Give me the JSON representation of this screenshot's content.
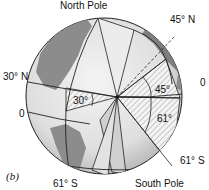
{
  "figure": {
    "panel_label": "(b)",
    "labels": {
      "north_pole": "North Pole",
      "south_pole": "South Pole",
      "lat_30n": "30° N",
      "lat_45n": "45° N",
      "lat_61s_left": "61° S",
      "lat_61s_right": "61° S",
      "equator_left": "0",
      "equator_right": "0",
      "angle_30": "30°",
      "angle_45": "45°",
      "angle_61": "61°"
    },
    "colors": {
      "globe_light": "#e6e6e6",
      "land": "#8c8c8c",
      "outline": "#222222",
      "hatch": "#9a9a9a"
    }
  }
}
